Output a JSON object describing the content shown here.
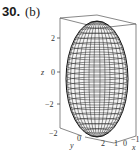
{
  "problem": {
    "number": "30.",
    "part": "(b)"
  },
  "figure": {
    "type": "3d-surface-plot",
    "surface": "ellipsoid",
    "z_axis": {
      "label": "z",
      "ticks": [
        "2",
        "0",
        "−2"
      ]
    },
    "y_axis": {
      "label": "y",
      "ticks": [
        "−2",
        "0",
        "2"
      ]
    },
    "x_axis": {
      "label": "x",
      "ticks": [
        "1",
        "0",
        "−1"
      ]
    },
    "colors": {
      "mesh": "#222222",
      "box": "#555555",
      "background": "#ffffff"
    }
  }
}
